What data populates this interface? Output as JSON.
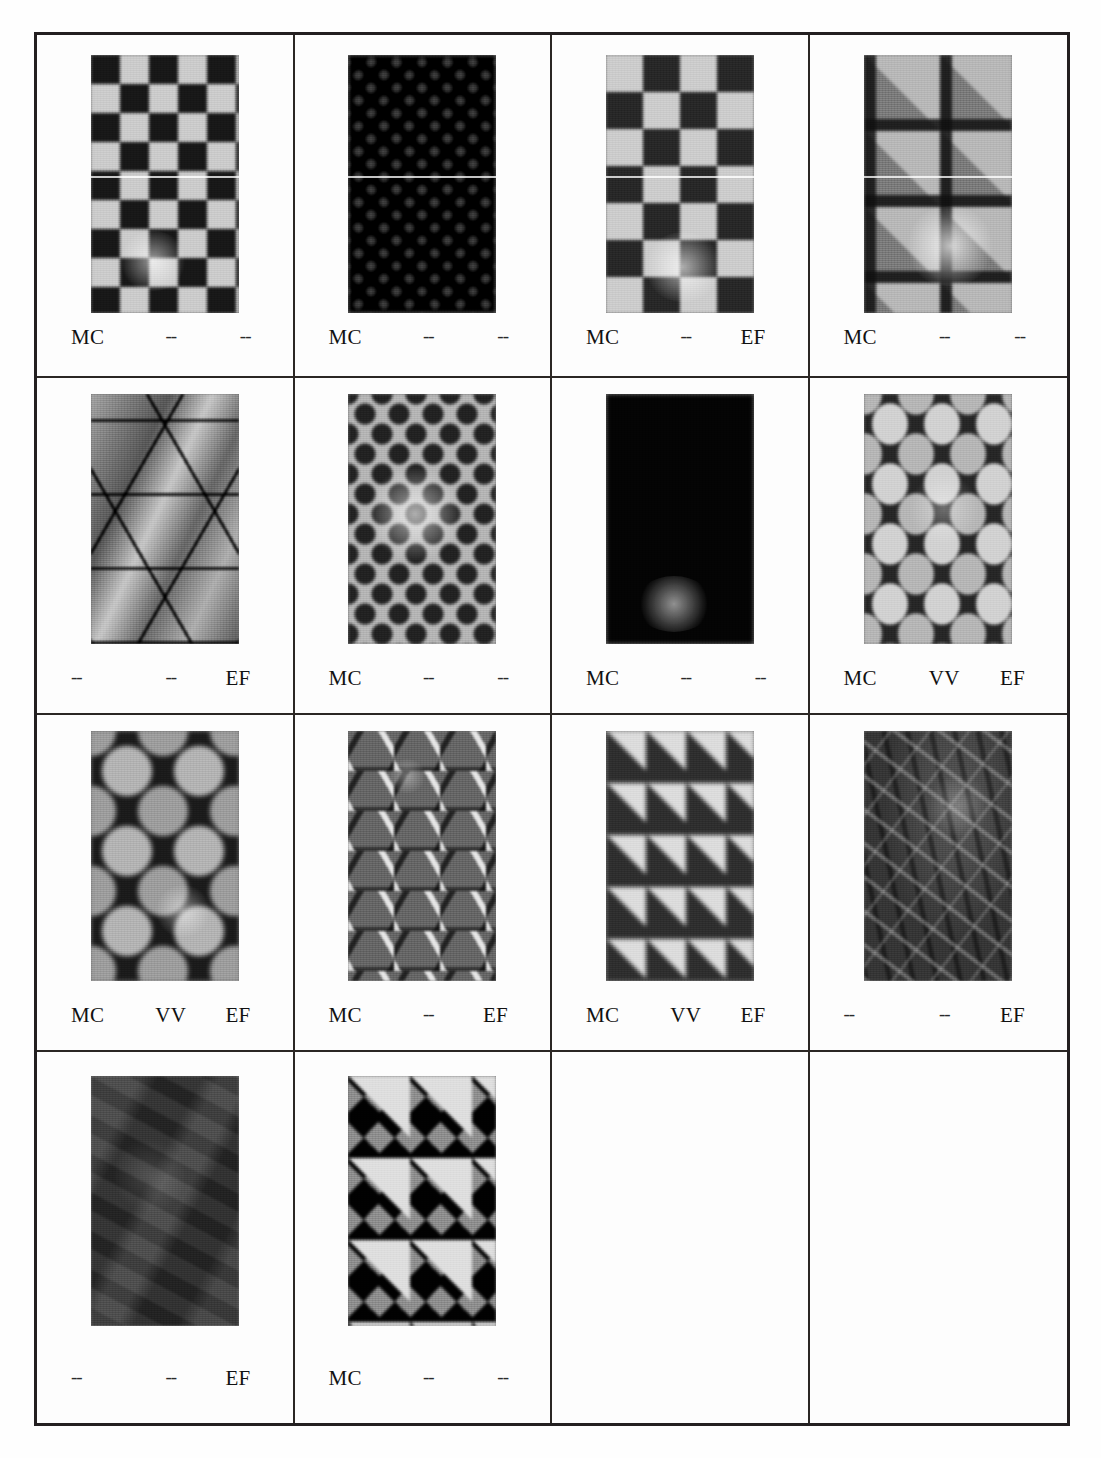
{
  "figure": {
    "kind": "micrograph-grid",
    "columns": 4,
    "rows": 4,
    "label_columns": [
      "MC",
      "VV",
      "EF"
    ],
    "absent_marker": "--",
    "border_color": "#231f20",
    "grid_line_color": "#2b2724"
  },
  "cells": [
    {
      "index": 1,
      "pattern_name": "coarse-checkerboard",
      "pattern_class": "pat-checker-coarse",
      "labels": {
        "mc": "MC",
        "vv": "--",
        "ef": "--"
      },
      "mc_present": true,
      "vv_present": false,
      "ef_present": false,
      "empty": false
    },
    {
      "index": 2,
      "pattern_name": "fine-diamond-lattice",
      "pattern_class": "pat-diamond-fine",
      "labels": {
        "mc": "MC",
        "vv": "--",
        "ef": "--"
      },
      "mc_present": true,
      "vv_present": false,
      "ef_present": false,
      "empty": false
    },
    {
      "index": 3,
      "pattern_name": "checkerboard-with-octagon-insets",
      "pattern_class": "pat-checker-octa",
      "labels": {
        "mc": "MC",
        "vv": "--",
        "ef": "EF"
      },
      "mc_present": true,
      "vv_present": false,
      "ef_present": true,
      "empty": false
    },
    {
      "index": 4,
      "pattern_name": "large-squares-with-diamond-gaps",
      "pattern_class": "pat-square-gap",
      "labels": {
        "mc": "MC",
        "vv": "--",
        "ef": "--"
      },
      "mc_present": true,
      "vv_present": false,
      "ef_present": false,
      "empty": false
    },
    {
      "index": 5,
      "pattern_name": "large-triangle-tessellation",
      "pattern_class": "pat-triangle",
      "labels": {
        "mc": "--",
        "vv": "--",
        "ef": "EF"
      },
      "mc_present": false,
      "vv_present": false,
      "ef_present": true,
      "empty": false
    },
    {
      "index": 6,
      "pattern_name": "hexagonal-close-packed-dots",
      "pattern_class": "pat-hexdots",
      "labels": {
        "mc": "MC",
        "vv": "--",
        "ef": "--"
      },
      "mc_present": true,
      "vv_present": false,
      "ef_present": false,
      "empty": false
    },
    {
      "index": 7,
      "pattern_name": "octagon-lattice-dark-nodes",
      "pattern_class": "pat-octa-lattice",
      "labels": {
        "mc": "MC",
        "vv": "--",
        "ef": "--"
      },
      "mc_present": true,
      "vv_present": false,
      "ef_present": false,
      "empty": false
    },
    {
      "index": 8,
      "pattern_name": "rounded-grain-grid",
      "pattern_class": "pat-round-grains",
      "labels": {
        "mc": "MC",
        "vv": "VV",
        "ef": "EF"
      },
      "mc_present": true,
      "vv_present": true,
      "ef_present": true,
      "empty": false
    },
    {
      "index": 9,
      "pattern_name": "large-circles-in-dark-net",
      "pattern_class": "pat-big-circles",
      "labels": {
        "mc": "MC",
        "vv": "VV",
        "ef": "EF"
      },
      "mc_present": true,
      "vv_present": true,
      "ef_present": true,
      "empty": false
    },
    {
      "index": 10,
      "pattern_name": "triangles-with-bright-facets",
      "pattern_class": "pat-triangle-bright",
      "labels": {
        "mc": "MC",
        "vv": "--",
        "ef": "EF"
      },
      "mc_present": true,
      "vv_present": false,
      "ef_present": true,
      "empty": false
    },
    {
      "index": 11,
      "pattern_name": "medium-diamond-lattice",
      "pattern_class": "pat-diamond-mid",
      "labels": {
        "mc": "MC",
        "vv": "VV",
        "ef": "EF"
      },
      "mc_present": true,
      "vv_present": true,
      "ef_present": true,
      "empty": false
    },
    {
      "index": 12,
      "pattern_name": "dark-irregular-crystals",
      "pattern_class": "pat-dark-crystals",
      "labels": {
        "mc": "--",
        "vv": "--",
        "ef": "EF"
      },
      "mc_present": false,
      "vv_present": false,
      "ef_present": true,
      "empty": false
    },
    {
      "index": 13,
      "pattern_name": "dark-low-contrast-grains",
      "pattern_class": "pat-dark-flat",
      "labels": {
        "mc": "--",
        "vv": "--",
        "ef": "EF"
      },
      "mc_present": false,
      "vv_present": false,
      "ef_present": true,
      "empty": false
    },
    {
      "index": 14,
      "pattern_name": "large-bright-diamond-lattice",
      "pattern_class": "pat-big-diamond",
      "labels": {
        "mc": "MC",
        "vv": "--",
        "ef": "--"
      },
      "mc_present": true,
      "vv_present": false,
      "ef_present": false,
      "empty": false
    },
    {
      "index": 15,
      "pattern_name": "empty",
      "pattern_class": "",
      "labels": {
        "mc": "",
        "vv": "",
        "ef": ""
      },
      "mc_present": false,
      "vv_present": false,
      "ef_present": false,
      "empty": true
    },
    {
      "index": 16,
      "pattern_name": "empty",
      "pattern_class": "",
      "labels": {
        "mc": "",
        "vv": "",
        "ef": ""
      },
      "mc_present": false,
      "vv_present": false,
      "ef_present": false,
      "empty": true
    }
  ]
}
